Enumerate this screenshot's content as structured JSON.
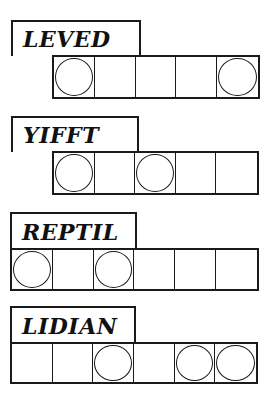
{
  "puzzles": [
    {
      "scrambled": "LEVED",
      "cell_count": 5,
      "circled_positions": [
        0,
        4
      ],
      "layout": {
        "label": {
          "x": 11,
          "y": 20,
          "w": 130,
          "h": 36
        },
        "cells": {
          "x": 52,
          "y": 55,
          "w": 208,
          "h": 44
        }
      }
    },
    {
      "scrambled": "YIFFT",
      "cell_count": 5,
      "circled_positions": [
        0,
        2
      ],
      "layout": {
        "label": {
          "x": 11,
          "y": 116,
          "w": 128,
          "h": 36
        },
        "cells": {
          "x": 52,
          "y": 151,
          "w": 207,
          "h": 44
        }
      }
    },
    {
      "scrambled": "REPTIL",
      "cell_count": 6,
      "circled_positions": [
        0,
        2
      ],
      "layout": {
        "label": {
          "x": 10,
          "y": 212,
          "w": 127,
          "h": 37
        },
        "cells": {
          "x": 10,
          "y": 248,
          "w": 249,
          "h": 43
        }
      }
    },
    {
      "scrambled": "LIDIAN",
      "cell_count": 6,
      "circled_positions": [
        2,
        4,
        5
      ],
      "layout": {
        "label": {
          "x": 10,
          "y": 306,
          "w": 126,
          "h": 37
        },
        "cells": {
          "x": 10,
          "y": 342,
          "w": 248,
          "h": 42
        }
      }
    }
  ],
  "colors": {
    "ink": "#1a1a1a",
    "paper": "#ffffff"
  }
}
